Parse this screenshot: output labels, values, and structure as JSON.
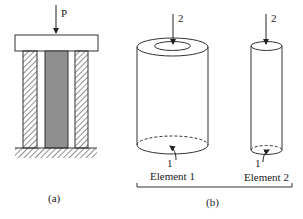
{
  "figure": {
    "part_a": {
      "caption": "(a)",
      "load_label": "P",
      "components": [
        "rigid-top-plate",
        "outer-hatched-tube",
        "inner-core-rod",
        "fixed-ground-support"
      ],
      "colors": {
        "core": "#8f8f8f",
        "line": "#333333",
        "background": "#ffffff"
      }
    },
    "part_b": {
      "caption": "(b)",
      "element_1": {
        "label": "Element 1",
        "node_top": "2",
        "node_bottom": "1",
        "shape": "hollow-cylinder"
      },
      "element_2": {
        "label": "Element 2",
        "node_top": "2",
        "node_bottom": "1",
        "shape": "solid-cylinder"
      }
    }
  }
}
